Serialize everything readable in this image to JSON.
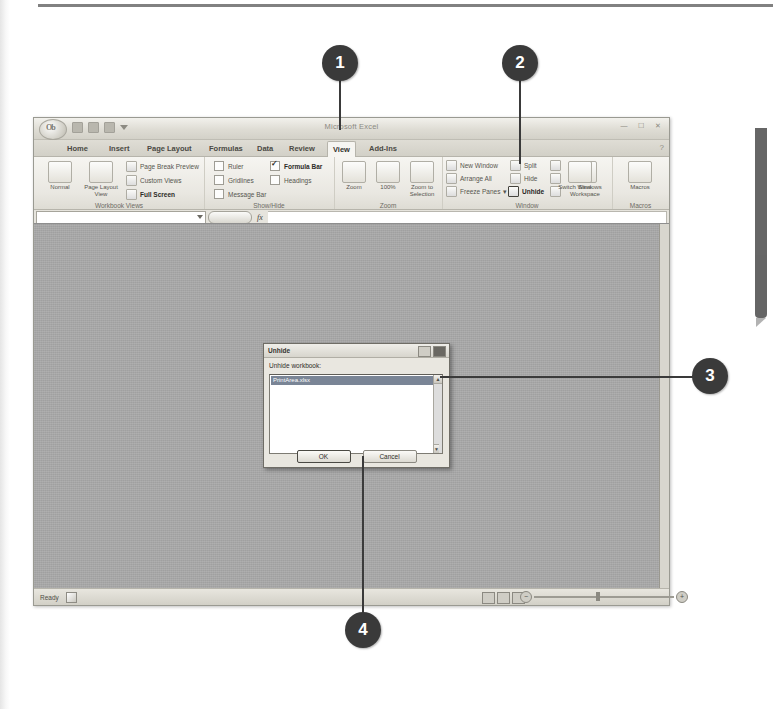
{
  "window": {
    "app_title": "Microsoft Excel",
    "office_button": "Office",
    "quick_access": [
      "save-icon",
      "undo-icon",
      "redo-icon",
      "customize-qat-icon"
    ],
    "window_buttons": [
      "minimize",
      "restore",
      "close"
    ],
    "help_icon": "help-question-icon"
  },
  "tabs": [
    {
      "label": "Home",
      "selected": false
    },
    {
      "label": "Insert",
      "selected": false
    },
    {
      "label": "Page Layout",
      "selected": false
    },
    {
      "label": "Formulas",
      "selected": false
    },
    {
      "label": "Data",
      "selected": false
    },
    {
      "label": "Review",
      "selected": false
    },
    {
      "label": "View",
      "selected": true
    },
    {
      "label": "Add-Ins",
      "selected": false
    }
  ],
  "ribbon": {
    "groups": [
      {
        "name": "Workbook Views",
        "big_buttons": [
          {
            "label": "Normal",
            "icon": "normal-view-icon"
          },
          {
            "label": "Page Layout View",
            "icon": "page-layout-view-icon"
          }
        ],
        "small_buttons": [
          {
            "label": "Page Break Preview",
            "icon": "page-break-preview-icon"
          },
          {
            "label": "Custom Views",
            "icon": "custom-views-icon"
          },
          {
            "label": "Full Screen",
            "icon": "full-screen-icon"
          }
        ]
      },
      {
        "name": "Show/Hide",
        "checkboxes": [
          {
            "label": "Ruler",
            "checked": false
          },
          {
            "label": "Gridlines",
            "checked": false
          },
          {
            "label": "Message Bar",
            "checked": false
          },
          {
            "label": "Formula Bar",
            "checked": true
          },
          {
            "label": "Headings",
            "checked": false
          }
        ]
      },
      {
        "name": "Zoom",
        "big_buttons": [
          {
            "label": "Zoom",
            "icon": "zoom-magnifier-icon"
          },
          {
            "label": "100%",
            "icon": "zoom-100-icon"
          },
          {
            "label": "Zoom to Selection",
            "icon": "zoom-to-selection-icon"
          }
        ]
      },
      {
        "name": "Window",
        "small_buttons": [
          {
            "label": "New Window",
            "icon": "new-window-icon"
          },
          {
            "label": "Arrange All",
            "icon": "arrange-all-icon"
          },
          {
            "label": "Freeze Panes",
            "icon": "freeze-panes-icon"
          },
          {
            "label": "Split",
            "icon": "split-icon"
          },
          {
            "label": "Hide",
            "icon": "hide-icon"
          },
          {
            "label": "Unhide",
            "icon": "unhide-icon"
          },
          {
            "label": "View Side by Side",
            "icon": "side-by-side-icon"
          },
          {
            "label": "Synchronous Scrolling",
            "icon": "sync-scroll-icon"
          },
          {
            "label": "Reset Window Position",
            "icon": "reset-window-icon"
          }
        ],
        "big_buttons": [
          {
            "label": "Save Workspace",
            "icon": "save-workspace-icon"
          },
          {
            "label": "Switch Windows",
            "icon": "switch-windows-icon"
          }
        ]
      },
      {
        "name": "Macros",
        "big_buttons": [
          {
            "label": "Macros",
            "icon": "macros-icon"
          }
        ]
      }
    ]
  },
  "formula_bar": {
    "name_box_value": "",
    "name_box_dropdown": "chevron-down-icon",
    "fx_label": "fx",
    "formula_value": ""
  },
  "dialog": {
    "title": "Unhide",
    "titlebar_buttons": [
      "help-icon",
      "close-icon"
    ],
    "list_label": "Unhide workbook:",
    "list_items": [
      "PrintArea.xlsx"
    ],
    "selected_index": 0,
    "buttons": [
      {
        "label": "OK",
        "default": true
      },
      {
        "label": "Cancel",
        "default": false
      }
    ],
    "scroll_up_icon": "scroll-up-arrow-icon",
    "scroll_down_icon": "scroll-down-arrow-icon"
  },
  "status_bar": {
    "status_text": "Ready",
    "status_icon": "record-macro-icon",
    "view_buttons": [
      "normal-view-button",
      "page-layout-button",
      "page-break-button"
    ],
    "zoom_out_label": "−",
    "zoom_in_label": "+"
  },
  "callouts": [
    {
      "number": "1"
    },
    {
      "number": "2"
    },
    {
      "number": "3"
    },
    {
      "number": "4"
    }
  ],
  "colors": {
    "callout_bg": "#3a3a3a",
    "callout_fg": "#ffffff",
    "selection_bg": "#7a8596",
    "sheet_bg": "#a8a8a8"
  }
}
